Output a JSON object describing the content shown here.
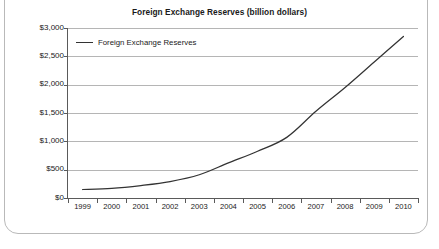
{
  "figure": {
    "frame": "rounded-border",
    "background": "#ffffff"
  },
  "chart_data": {
    "type": "line",
    "title": "Foreign Exchange Reserves (billion dollars)",
    "xlabel": "",
    "ylabel": "",
    "categories": [
      "1999",
      "2000",
      "2001",
      "2002",
      "2003",
      "2004",
      "2005",
      "2006",
      "2007",
      "2008",
      "2009",
      "2010"
    ],
    "series": [
      {
        "name": "Foreign Exchange Reserves",
        "color": "#333333",
        "values": [
          150,
          170,
          220,
          290,
          410,
          620,
          825,
          1070,
          1530,
          1950,
          2400,
          2850
        ]
      }
    ],
    "ylim": [
      0,
      3000
    ],
    "ytick_values": [
      0,
      500,
      1000,
      1500,
      2000,
      2500,
      3000
    ],
    "ytick_labels": [
      "$0",
      "$500",
      "$1,000",
      "$1,500",
      "$2,000",
      "$2,500",
      "$3,000"
    ],
    "xtick_labels": [
      "1999",
      "2000",
      "2001",
      "2002",
      "2003",
      "2004",
      "2005",
      "2006",
      "2007",
      "2008",
      "2009",
      "2010"
    ],
    "grid": "horizontal",
    "grid_color": "#b5b5b9",
    "legend": {
      "position": "inside-top-left",
      "entries": [
        "Foreign Exchange Reserves"
      ]
    },
    "axis_color": "#5a5a5a"
  }
}
